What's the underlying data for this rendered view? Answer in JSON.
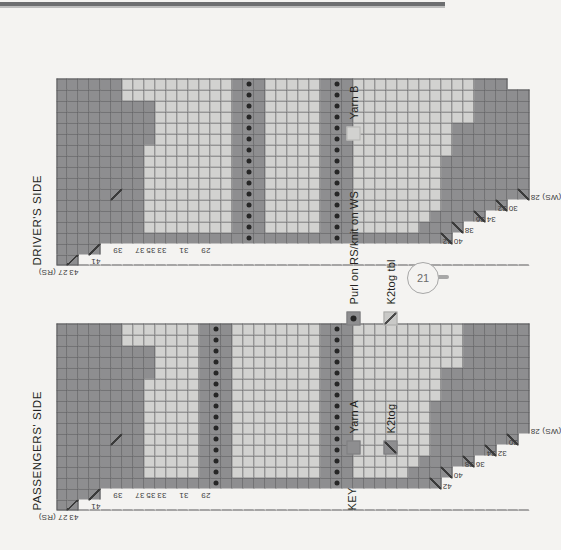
{
  "page": {
    "folio_number": "21",
    "background_color": "#f4f3f1",
    "rule_color": "#6d6e70"
  },
  "charts": [
    {
      "id": "passengers-side",
      "title": "PASSENGERS' SIDE",
      "rs_label": "27 (RS)",
      "ws_label": "(WS) 28",
      "odd_row_numbers": [
        "43",
        "41",
        "39",
        "37",
        "35",
        "33",
        "31",
        "29",
        "27 (RS)"
      ],
      "even_row_numbers": [
        "42",
        "40",
        "38",
        "36",
        "34",
        "32",
        "30",
        "(WS) 28"
      ],
      "stitch_columns": 17,
      "rows": 43
    },
    {
      "id": "drivers-side",
      "title": "DRIVER'S SIDE",
      "rs_label": "27 (RS)",
      "ws_label": "(WS) 28",
      "odd_row_numbers": [
        "43",
        "41",
        "39",
        "37",
        "35",
        "33",
        "31",
        "29",
        "27 (RS)"
      ],
      "even_row_numbers": [
        "42",
        "40",
        "38",
        "36",
        "34",
        "32",
        "30",
        "(WS) 28"
      ],
      "stitch_columns": 17,
      "rows": 43
    }
  ],
  "key": {
    "title": "KEY",
    "items": [
      {
        "symbol": "yarn-a-swatch",
        "label": "Yarn A",
        "color": "#8e8e90"
      },
      {
        "symbol": "yarn-b-swatch",
        "label": "Yarn B",
        "color": "#d2d2d0"
      },
      {
        "symbol": "purl-swatch",
        "label": "Purl on RS/knit on WS",
        "color": "#8e8e90"
      },
      {
        "symbol": "k2tog-tbl-swatch",
        "label": "K2tog tbl",
        "color": "#c9c9c7"
      },
      {
        "symbol": "k2tog-swatch",
        "label": "K2tog",
        "color": "#8e8e90"
      }
    ]
  },
  "chart_data": {
    "type": "heatmap",
    "xlabel": "Stitches",
    "ylabel": "Rows",
    "legend": [
      "Yarn A",
      "Yarn B",
      "Purl on RS/knit on WS",
      "K2tog tbl",
      "K2tog"
    ],
    "cell_codes": {
      "a": "Yarn A (dark grey)",
      "b": "Yarn B (light grey)",
      "d": "Yarn A with purl dot",
      "x": "K2tog decrease (diagonal, lower-left to upper-right)",
      "y": "K2tog tbl decrease (diagonal, upper-left to lower-right)",
      ".": "no stitch / blank"
    },
    "passengers_side_rows": [
      "aaaaaaaaaaaaaaaaa",
      "xaaaaaaaaaaaaaaaa",
      ".aaaaaaaaaaaaaaaa",
      ".xaaaaaaaaaaaaaaa",
      "..aaaaaaaaaaaaaaa",
      "..aaaaxaaaaaaaaaa",
      "..aaaaaaaaaaaaabb",
      "..aaaaaaaaaaaaabb",
      "..abbbbbbbbbaaabb",
      "..abbbbbbbbbbbbbb",
      "..abbbbbbbbbbbbbb",
      "..abbbbbbbbbbbbbb",
      "..abbbbbbbbbbbbbb",
      "..aaaaaaaaaaaaaaa",
      "..ddddddddddddddd",
      "..aaaaaaaaaaaaaaa",
      "..abbbbbbbbbbbbbb",
      "..abbbbbbbbbbbbbb",
      "..abbbbbbbbbbbbbb",
      "..abbbbbbbbbbbbbb",
      "..abbbbbbbbbbbbbb",
      "..abbbbbbbbbbbbbb",
      "..abbbbbbbbbbbbbb",
      "..abbbbbbbbbbbbbb",
      "..aaaaaaaaaaaaaaa",
      "..ddddddddddddddd",
      "..aaaaaaaaaaaaaaa",
      "..abbbbbbbbbbbbbb",
      "..abbbbbbbbbbbbbb",
      "..abbbbbbbbbbbbbb",
      "..abbbbbbbbbbbbbb",
      "..abbbbbbbbbbbbbb",
      "..aabbbbbbbbbbbbb",
      "..aaabbbbbbbbbbbb",
      "..yaaaaaaabbbbbbb",
      "...yaaaaaaaaabbbb",
      "....aaaaaaaaabbbb",
      "....yaaaaaaaaaaaa",
      ".....aaaaaaaaaaaa",
      ".....yaaaaaaaaaaa",
      "......aaaaaaaaaaa",
      "......yaaaaaaaaaa",
      ".......aaaaaaaaaa"
    ],
    "drivers_side_rows": [
      "aaaaaaaaaaaaaaaaa",
      "xaaaaaaaaaaaaaaaa",
      ".aaaaaaaaaaaaaaaa",
      ".xaaaaaaaaaaaaaaa",
      "..aaaaaaaaaaaaaaa",
      "..aaaaxaaaaaaaaaa",
      "..aaaaaaaaaaaaabb",
      "..aaaaaaaaaaaaabb",
      "..abbbbbbbbaaaabb",
      "..abbbbbbbbbbbbbb",
      "..abbbbbbbbbbbbbb",
      "..abbbbbbbbbbbbbb",
      "..abbbbbbbbbbbbbb",
      "..abbbbbbbbbbbbbb",
      "..abbbbbbbbbbbbbb",
      "..abbbbbbbbbbbbbb",
      "..aaaaaaaaaaaaaaa",
      "..ddddddddddddddd",
      "..aaaaaaaaaaaaaaa",
      "..abbbbbbbbbbbbbb",
      "..abbbbbbbbbbbbbb",
      "..abbbbbbbbbbbbbb",
      "..abbbbbbbbbbbbbb",
      "..abbbbbbbbbbbbbb",
      "..aaaaaaaaaaaaaaa",
      "..ddddddddddddddd",
      "..aaaaaaaaaaaaaaa",
      "..abbbbbbbbbbbbbb",
      "..abbbbbbbbbbbbbb",
      "..abbbbbbbbbbbbbb",
      "..abbbbbbbbbbbbbb",
      "..abbbbbbbbbbbbbb",
      "..abbbbbbbbbbbbbb",
      "..aabbbbbbbbbbbbb",
      "..aaabbbbbbbbbbbb",
      "..yaaaaaaabbbbbbb",
      "...yaaaaaaaaabbbb",
      "....aaaaaaaaabbbb",
      "....yaaaaaaaaaaaa",
      ".....aaaaaaaaaaaa",
      ".....yaaaaaaaaaaa",
      "......aaaaaaaaaa.",
      "......yaaaaaaaaa."
    ]
  }
}
